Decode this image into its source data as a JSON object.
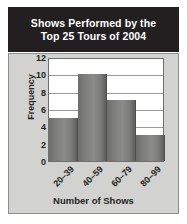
{
  "figure": {
    "title_lines": [
      "Shows Performed by the",
      "Top 25 Tours of 2004"
    ],
    "title_full": "Shows Performed by the Top 25 Tours of 2004"
  },
  "colors": {
    "title_bar_background": "#231f20",
    "title_text": "#ffffff",
    "panel_background": "#d2d2d0",
    "plot_background": "#ffffff",
    "bar_fill": "#7c7c7a",
    "gridline": "#9a9a98",
    "axis_text": "#231f20"
  },
  "chart_data": {
    "type": "bar",
    "title": "Shows Performed by the Top 25 Tours of 2004",
    "xlabel": "Number of Shows",
    "ylabel": "Frequency",
    "categories": [
      "20–39",
      "40–59",
      "60–79",
      "80–99"
    ],
    "values": [
      5,
      10,
      7,
      3
    ],
    "ylim": [
      0,
      12
    ],
    "ytick_labels": [
      "0",
      "2",
      "4",
      "6",
      "8",
      "10",
      "12"
    ],
    "ytick_values": [
      0,
      2,
      4,
      6,
      8,
      10,
      12
    ],
    "ytick_interval": 2,
    "grid": "horizontal",
    "legend": "none",
    "bar_gap": 0,
    "xtick_rotation_deg": -45
  }
}
